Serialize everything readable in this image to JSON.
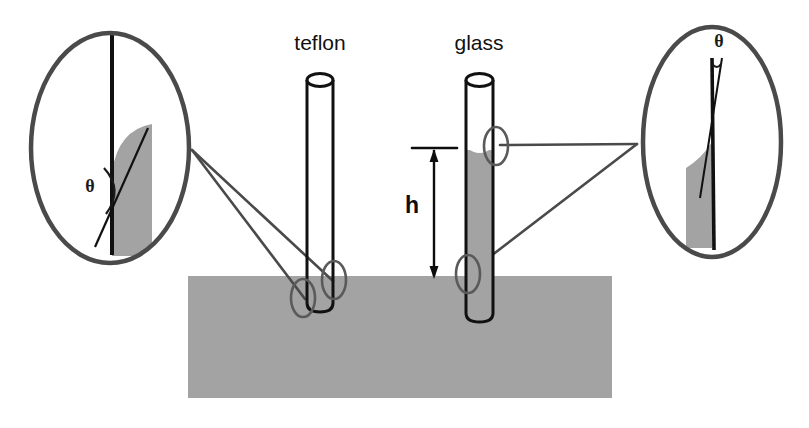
{
  "figure": {
    "canvas": {
      "width": 809,
      "height": 428,
      "background": "#ffffff"
    },
    "colors": {
      "liquid_gray": "#a3a3a3",
      "liquid_gray_light": "#b0b0b0",
      "outline_black": "#111111",
      "callout_gray": "#555555",
      "background": "#ffffff"
    },
    "labels": {
      "teflon": "teflon",
      "glass": "glass",
      "height": "h",
      "theta_left": "θ",
      "theta_right": "θ"
    },
    "bath": {
      "name": "liquid reservoir",
      "x": 188,
      "y": 276,
      "width": 424,
      "height": 122,
      "fill": "#a3a3a3"
    },
    "tubes": [
      {
        "id": "teflon-tube",
        "label": "teflon",
        "label_x": 320,
        "label_y": 42,
        "left": 307,
        "right": 333,
        "top": 72,
        "bottom": 312,
        "liquid_level_y": 296,
        "meniscus": "convex",
        "wetting": "non-wetting",
        "contact_angle_type": "obtuse"
      },
      {
        "id": "glass-tube",
        "label": "glass",
        "label_x": 479,
        "label_y": 42,
        "left": 466,
        "right": 493,
        "top": 72,
        "bottom": 322,
        "liquid_level_y": 148,
        "meniscus": "concave",
        "wetting": "wetting",
        "contact_angle_type": "acute"
      }
    ],
    "height_marker": {
      "name": "capillary-rise-h",
      "label": "h",
      "label_x": 413,
      "label_y": 212,
      "arrow_x": 434,
      "arrow_top_y": 148,
      "arrow_bottom_y": 278,
      "tick_x1": 413,
      "tick_x2": 456,
      "tick_y": 148
    },
    "callouts": [
      {
        "id": "teflon-callout",
        "side": "left",
        "center_x": 110,
        "center_y": 148,
        "radius_x": 82,
        "radius_y": 118,
        "theta_label": "θ",
        "theta_x": 90,
        "theta_y": 190,
        "angle_kind": "obtuse",
        "describes": "teflon-tube"
      },
      {
        "id": "glass-callout",
        "side": "right",
        "center_x": 712,
        "center_y": 142,
        "radius_x": 72,
        "radius_y": 118,
        "theta_label": "θ",
        "theta_x": 719,
        "theta_y": 46,
        "angle_kind": "acute",
        "describes": "glass-tube"
      }
    ],
    "highlight_markers": [
      {
        "id": "teflon-upper-marker",
        "cx": 334,
        "cy": 280,
        "rx": 12,
        "ry": 19
      },
      {
        "id": "teflon-lower-marker",
        "cx": 303,
        "cy": 298,
        "rx": 12,
        "ry": 19
      },
      {
        "id": "glass-upper-marker",
        "cx": 496,
        "cy": 146,
        "rx": 12,
        "ry": 19
      },
      {
        "id": "glass-lower-marker",
        "cx": 468,
        "cy": 274,
        "rx": 12,
        "ry": 19
      }
    ]
  }
}
